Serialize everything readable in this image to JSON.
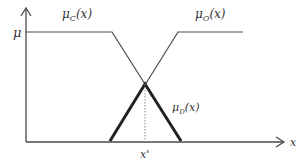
{
  "diagram": {
    "type": "fuzzy-membership-functions",
    "labels": {
      "mu_c": "μ",
      "mu_c_sub": "C",
      "mu_c_arg": "(x)",
      "mu_o": "μ",
      "mu_o_sub": "O",
      "mu_o_arg": "(x)",
      "mu_d": "μ",
      "mu_d_sub": "D",
      "mu_d_arg": "(x)",
      "y_axis": "μ",
      "x_axis": "x",
      "x_star": "x'"
    },
    "colors": {
      "line": "#4a4a4a",
      "bold_line": "#222222",
      "dotted": "#888888"
    }
  }
}
